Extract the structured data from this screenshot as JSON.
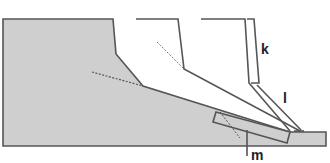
{
  "diagram": {
    "type": "cross-section",
    "fill_color": "#cfcfcf",
    "stroke_color": "#555555",
    "labels": {
      "k": "k",
      "l": "l",
      "m": "m"
    }
  }
}
